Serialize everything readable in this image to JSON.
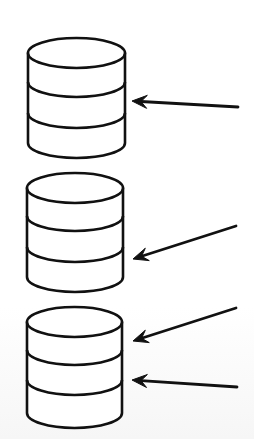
{
  "diagram": {
    "type": "storage-cylinders-with-arrows",
    "colors": {
      "background": "#ffffff",
      "stroke": "#111111",
      "fill": "#ffffff"
    },
    "cylinders": [
      {
        "id": "cylinder-1",
        "x_left": 28,
        "x_right": 125,
        "top_center_y": 53,
        "rx": 48.5,
        "ry": 15,
        "dividers_center_y": [
          82,
          113
        ],
        "bottom_center_y": 143,
        "segments": 3
      },
      {
        "id": "cylinder-2",
        "x_left": 27,
        "x_right": 123,
        "top_center_y": 188,
        "rx": 48,
        "ry": 15,
        "dividers_center_y": [
          216,
          247
        ],
        "bottom_center_y": 277,
        "segments": 3
      },
      {
        "id": "cylinder-3",
        "x_left": 27,
        "x_right": 122,
        "top_center_y": 322,
        "rx": 47.5,
        "ry": 15,
        "dividers_center_y": [
          350,
          380
        ],
        "bottom_center_y": 413,
        "segments": 3
      }
    ],
    "arrows": [
      {
        "id": "arrow-1",
        "target": "cylinder-1",
        "tail": [
          238,
          107
        ],
        "tip": [
          132,
          101
        ]
      },
      {
        "id": "arrow-2",
        "target": "cylinder-2",
        "tail": [
          236,
          226
        ],
        "tip": [
          133,
          259
        ]
      },
      {
        "id": "arrow-3",
        "target": "cylinder-3",
        "tail": [
          236,
          308
        ],
        "tip": [
          133,
          341
        ]
      },
      {
        "id": "arrow-4",
        "target": "cylinder-3",
        "tail": [
          237,
          387
        ],
        "tip": [
          132,
          380
        ]
      }
    ]
  }
}
